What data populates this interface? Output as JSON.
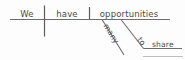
{
  "diagram": {
    "kind": "reed-kellogg-sentence-diagram",
    "sentence": "We have many opportunities to share.",
    "colors": {
      "line": "#6e6e6e",
      "line_faint": "#bdbdbd",
      "text": "#4a4a4a",
      "background": "#fdfdfd"
    },
    "baseline": {
      "subject": "We",
      "verb": "have",
      "direct_object": "opportunities"
    },
    "modifiers": {
      "adjective": "many",
      "infinitive_marker": "to",
      "infinitive_verb": "share"
    }
  }
}
